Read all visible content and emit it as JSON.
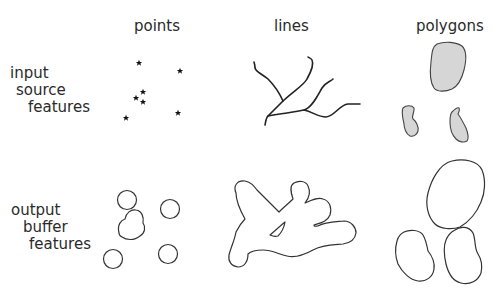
{
  "columns": [
    {
      "id": "points",
      "label": "points"
    },
    {
      "id": "lines",
      "label": "lines"
    },
    {
      "id": "polygons",
      "label": "polygons"
    }
  ],
  "rows": [
    {
      "id": "input",
      "label_lines": [
        "input",
        "source",
        "features"
      ]
    },
    {
      "id": "output",
      "label_lines": [
        "output",
        "buffer",
        "features"
      ]
    }
  ],
  "colors": {
    "stroke": "#222222",
    "polygon_fill": "#d6d6d6",
    "buffer_stroke": "#333333",
    "background": "#ffffff"
  }
}
